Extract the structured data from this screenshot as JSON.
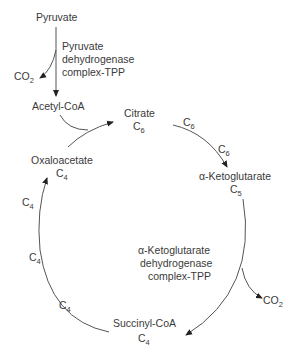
{
  "diagram": {
    "nodes": {
      "pyruvate": "Pyruvate",
      "acetyl_coa": "Acetyl-CoA",
      "citrate": "Citrate",
      "citrate_carbons": "C",
      "citrate_sub": "6",
      "oxaloacetate": "Oxaloacetate",
      "oxaloacetate_carbons": "C",
      "oxaloacetate_sub": "4",
      "alpha_ketoglutarate": "α-Ketoglutarate",
      "alpha_ketoglutarate_carbons": "C",
      "alpha_ketoglutarate_sub": "5",
      "succinyl_coa": "Succinyl-CoA",
      "succinyl_coa_carbons": "C",
      "succinyl_coa_sub": "4"
    },
    "enzymes": {
      "pdh": [
        "Pyruvate",
        "dehydrogenase",
        "complex-TPP"
      ],
      "akgdh": [
        "α-Ketoglutarate",
        "dehydrogenase",
        "complex-TPP"
      ]
    },
    "byproducts": {
      "co2_top": "CO",
      "co2_top_sub": "2",
      "co2_right": "CO",
      "co2_right_sub": "2"
    },
    "edge_labels": {
      "c6_a": "C",
      "c6_a_sub": "6",
      "c6_b": "C",
      "c6_b_sub": "6",
      "c4_a": "C",
      "c4_a_sub": "4",
      "c4_b": "C",
      "c4_b_sub": "4",
      "c4_c": "C",
      "c4_c_sub": "4"
    }
  }
}
